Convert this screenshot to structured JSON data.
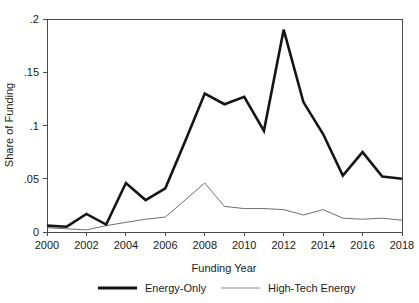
{
  "chart_data": {
    "type": "line",
    "title": "",
    "xlabel": "Funding Year",
    "ylabel": "Share of Funding",
    "x": [
      2000,
      2001,
      2002,
      2003,
      2004,
      2005,
      2006,
      2007,
      2008,
      2009,
      2010,
      2011,
      2012,
      2013,
      2014,
      2015,
      2016,
      2017,
      2018
    ],
    "xlim": [
      2000,
      2018
    ],
    "ylim": [
      0,
      0.2
    ],
    "xticks": [
      2000,
      2002,
      2004,
      2006,
      2008,
      2010,
      2012,
      2014,
      2016,
      2018
    ],
    "xtick_labels": [
      "2000",
      "2002",
      "2004",
      "2006",
      "2008",
      "2010",
      "2012",
      "2014",
      "2016",
      "2018"
    ],
    "yticks": [
      0,
      0.05,
      0.1,
      0.15,
      0.2
    ],
    "ytick_labels": [
      "0",
      ".05",
      ".1",
      ".15",
      ".2"
    ],
    "grid": false,
    "legend_position": "bottom",
    "series": [
      {
        "name": "Energy-Only",
        "style": "thick-solid",
        "color": "#151515",
        "values": [
          0.006,
          0.005,
          0.017,
          0.007,
          0.046,
          0.03,
          0.041,
          0.085,
          0.13,
          0.12,
          0.127,
          0.095,
          0.19,
          0.122,
          0.092,
          0.053,
          0.075,
          0.052,
          0.05
        ]
      },
      {
        "name": "High-Tech Energy",
        "style": "thin-solid",
        "color": "#6f6f6f",
        "values": [
          0.004,
          0.003,
          0.002,
          0.006,
          0.009,
          0.012,
          0.014,
          0.03,
          0.046,
          0.024,
          0.022,
          0.022,
          0.021,
          0.016,
          0.021,
          0.013,
          0.012,
          0.013,
          0.011
        ]
      }
    ]
  },
  "legend": {
    "entries": [
      {
        "label": "Energy-Only"
      },
      {
        "label": "High-Tech Energy"
      }
    ]
  }
}
